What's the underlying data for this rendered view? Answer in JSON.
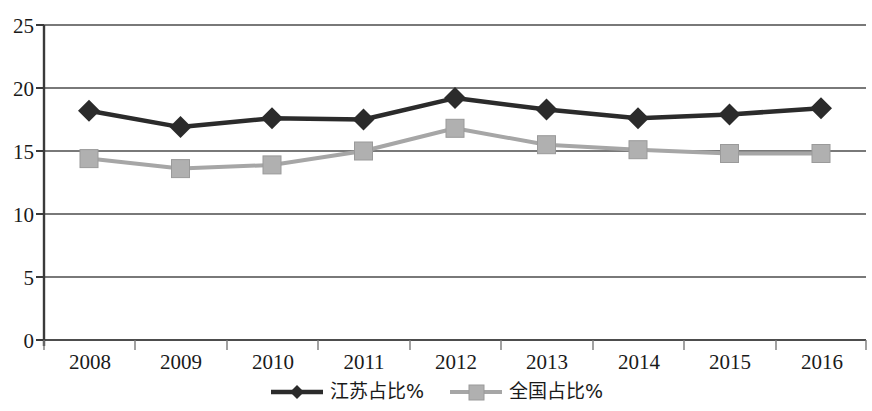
{
  "chart_data": {
    "type": "line",
    "title": "",
    "subtitle": "",
    "xlabel": "",
    "ylabel": "",
    "categories": [
      "2008",
      "2009",
      "2010",
      "2011",
      "2012",
      "2013",
      "2014",
      "2015",
      "2016"
    ],
    "series": [
      {
        "name": "江苏占比%",
        "color": "#2b2b2b",
        "marker": "diamond",
        "values": [
          18.2,
          16.9,
          17.6,
          17.5,
          19.2,
          18.3,
          17.6,
          17.9,
          18.4
        ]
      },
      {
        "name": "全国占比%",
        "color": "#a6a6a6",
        "marker": "square",
        "values": [
          14.4,
          13.6,
          13.9,
          15.0,
          16.8,
          15.5,
          15.1,
          14.8,
          14.8
        ]
      }
    ],
    "ylim": [
      0,
      25
    ],
    "yticks": [
      "0",
      "5",
      "10",
      "15",
      "20",
      "25"
    ],
    "ytick_values": [
      0,
      5,
      10,
      15,
      20,
      25
    ],
    "grid": "horizontal",
    "legend_position": "bottom"
  },
  "axes": {
    "y_tick_labels": [
      "25",
      "20",
      "15",
      "10",
      "5",
      "0"
    ],
    "x_tick_labels": [
      "2008",
      "2009",
      "2010",
      "2011",
      "2012",
      "2013",
      "2014",
      "2015",
      "2016"
    ]
  },
  "legend": {
    "entries": [
      {
        "label": "江苏占比%",
        "color": "#2b2b2b",
        "marker": "diamond"
      },
      {
        "label": "全国占比%",
        "color": "#a6a6a6",
        "marker": "square"
      }
    ]
  },
  "colors": {
    "series_primary": "#2b2b2b",
    "series_secondary": "#a6a6a6",
    "axis": "#3a3a3a",
    "grid": "#4d4d4d",
    "background": "#ffffff"
  }
}
